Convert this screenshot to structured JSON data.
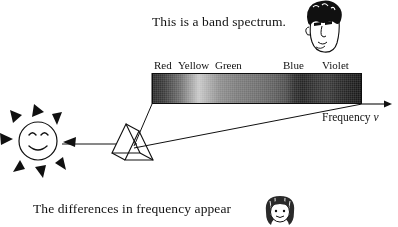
{
  "figure": {
    "type": "physics-illustration",
    "background_color": "#ffffff",
    "ink_color": "#101010"
  },
  "captions": {
    "top": "This is a band spectrum.",
    "bottom": "The differences in frequency appear"
  },
  "spectrum": {
    "band_labels": [
      {
        "text": "Red",
        "left_px": 154
      },
      {
        "text": "Yellow",
        "left_px": 178
      },
      {
        "text": "Green",
        "left_px": 215
      },
      {
        "text": "Blue",
        "left_px": 283
      },
      {
        "text": "Violet",
        "left_px": 322
      }
    ],
    "band": {
      "x_px": 152,
      "y_px": 73,
      "width_px": 210,
      "height_px": 31,
      "appearance": "halftone grayscale gradient, dark at red end, bright near yellow, darkening to black at violet end"
    },
    "axis": {
      "label": "Frequency",
      "symbol": "ν",
      "arrow_direction": "right",
      "arrow_from_px": 362,
      "arrow_to_px": 390,
      "arrow_y_px": 104
    }
  },
  "objects": [
    {
      "name": "sun",
      "kind": "smiling-sun-face",
      "center_px": [
        38,
        141
      ],
      "radius_px": 19,
      "rays": 8
    },
    {
      "name": "prism",
      "kind": "triangular-glass-prism",
      "center_px": [
        130,
        142
      ]
    },
    {
      "name": "incident-ray",
      "kind": "arrow",
      "from_px": [
        62,
        144
      ],
      "to_px": [
        135,
        144
      ]
    },
    {
      "name": "man-head",
      "kind": "cartoon-face-dark-curly-hair",
      "center_px": [
        323,
        26
      ]
    },
    {
      "name": "girl-head",
      "kind": "cartoon-face-bob-hair",
      "center_px": [
        280,
        212
      ]
    }
  ],
  "icons": {
    "sun": "sun-face-icon",
    "prism": "prism-icon",
    "arrow": "arrow-right-icon",
    "man": "man-head-icon",
    "girl": "girl-head-icon"
  }
}
